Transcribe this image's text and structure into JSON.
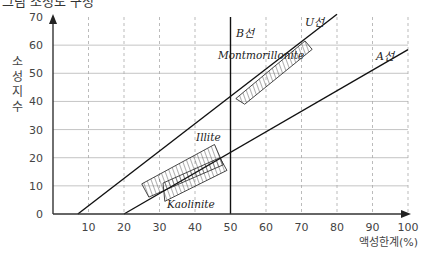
{
  "header": {
    "title_partial": "그림 소성도 구성"
  },
  "chart_data": {
    "type": "line",
    "title": "",
    "xlabel": "액성한계(%)",
    "ylabel": "소성지수",
    "ylabel_chars": [
      "소",
      "성",
      "지",
      "수"
    ],
    "xlim": [
      0,
      100
    ],
    "ylim": [
      0,
      70
    ],
    "xticks": [
      10,
      20,
      30,
      40,
      50,
      60,
      70,
      80,
      90,
      100
    ],
    "yticks": [
      0,
      10,
      20,
      30,
      40,
      50,
      60,
      70
    ],
    "grid": {
      "x": "dashed",
      "y": "solid"
    },
    "lines": [
      {
        "name": "U선",
        "label": "U선",
        "points": [
          [
            7,
            0
          ],
          [
            80,
            71
          ]
        ]
      },
      {
        "name": "A선",
        "label": "A선",
        "points": [
          [
            20,
            0
          ],
          [
            100,
            58.4
          ]
        ]
      },
      {
        "name": "B선",
        "label": "B선",
        "points": [
          [
            50,
            0
          ],
          [
            50,
            70
          ]
        ]
      }
    ],
    "regions": [
      {
        "name": "Montmorillonite",
        "label": "Montmorillonite",
        "polygon": [
          [
            51.5,
            41
          ],
          [
            71,
            61.5
          ],
          [
            73,
            58.5
          ],
          [
            54,
            39
          ]
        ]
      },
      {
        "name": "Illite",
        "label": "Illite",
        "polygon": [
          [
            25,
            10.7
          ],
          [
            45.5,
            24.7
          ],
          [
            48,
            17.5
          ],
          [
            27,
            6
          ]
        ]
      },
      {
        "name": "Kaolinite",
        "label": "Kaolinite",
        "polygon": [
          [
            31,
            11
          ],
          [
            47,
            20
          ],
          [
            49,
            15.5
          ],
          [
            31.5,
            4.5
          ]
        ]
      }
    ]
  }
}
